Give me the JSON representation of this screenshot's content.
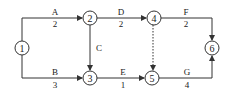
{
  "nodes": [
    {
      "id": "1",
      "label": "1",
      "x": 22,
      "y": 48
    },
    {
      "id": "2",
      "label": "2",
      "x": 90,
      "y": 18
    },
    {
      "id": "3",
      "label": "3",
      "x": 90,
      "y": 78
    },
    {
      "id": "4",
      "label": "4",
      "x": 154,
      "y": 18
    },
    {
      "id": "5",
      "label": "5",
      "x": 152,
      "y": 78
    },
    {
      "id": "6",
      "label": "6",
      "x": 212,
      "y": 48
    }
  ],
  "activities": [
    {
      "name": "A",
      "duration": "2",
      "from": "1",
      "to": "2"
    },
    {
      "name": "B",
      "duration": "3",
      "from": "1",
      "to": "3"
    },
    {
      "name": "C",
      "duration": "",
      "from": "2",
      "to": "3"
    },
    {
      "name": "D",
      "duration": "2",
      "from": "2",
      "to": "4"
    },
    {
      "name": "E",
      "duration": "1",
      "from": "3",
      "to": "5"
    },
    {
      "name": "F",
      "duration": "2",
      "from": "4",
      "to": "6"
    },
    {
      "name": "G",
      "duration": "4",
      "from": "5",
      "to": "6"
    },
    {
      "name": "dummy",
      "duration": "",
      "from": "4",
      "to": "5",
      "style": "dashed"
    }
  ],
  "colors": {
    "line": "#333333",
    "node_fill": "#ffffff"
  }
}
